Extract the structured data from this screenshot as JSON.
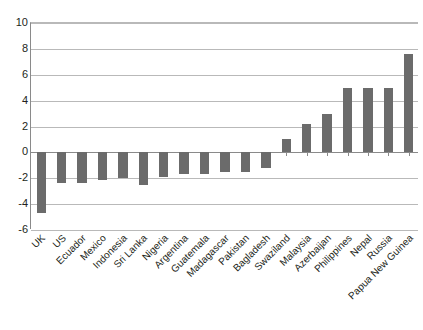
{
  "chart_data": {
    "type": "bar",
    "title": "",
    "xlabel": "",
    "ylabel": "",
    "ylim": [
      -6,
      10
    ],
    "yticks": [
      10,
      8,
      6,
      4,
      2,
      0,
      -2,
      -4,
      -6
    ],
    "ytick_labels": [
      "10",
      "8",
      "6",
      "4",
      "2",
      "0",
      "-2",
      "-4",
      "-6"
    ],
    "grid": true,
    "legend": false,
    "legend_position": "none",
    "bar_color": "#6b6b6b",
    "gridline_color": "#b9b9b9",
    "axis_color": "#8a8a8a",
    "categories": [
      "UK",
      "US",
      "Ecuador",
      "Mexico",
      "Indonesia",
      "Sri Lanka",
      "Nigeria",
      "Argentina",
      "Guatemala",
      "Madagascar",
      "Pakistan",
      "Bagladesh",
      "Swaziland",
      "Malaysia",
      "Azerbaijan",
      "Philippines",
      "Nepal",
      "Russia",
      "Papua New Guinea"
    ],
    "values": [
      -4.7,
      -2.4,
      -2.4,
      -2.1,
      -2.0,
      -2.5,
      -1.9,
      -1.7,
      -1.7,
      -1.5,
      -1.5,
      -1.2,
      1.0,
      2.2,
      3.0,
      5.0,
      5.0,
      5.0,
      7.6
    ]
  }
}
